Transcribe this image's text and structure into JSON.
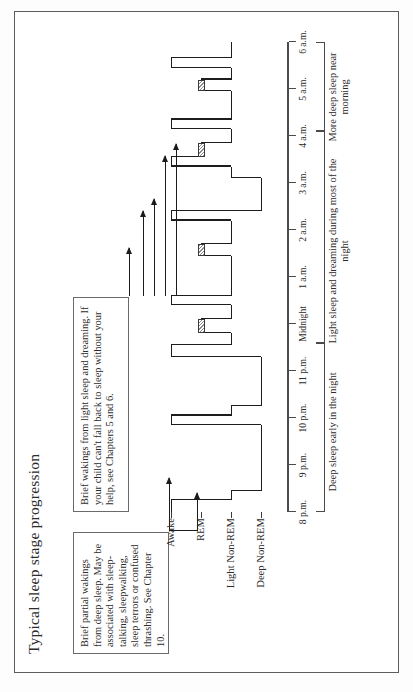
{
  "figure": {
    "title": "Typical sleep stage progression",
    "callouts": [
      {
        "id": "deep-sleep-callout",
        "text": "Brief partial wakings from deep sleep. May be associated with sleep-talking, sleepwalking, sleep terrors or confused thrashing. See Chapter 10."
      },
      {
        "id": "light-sleep-callout",
        "text": "Brief wakings from light sleep and dreaming. If your child can't fall back to sleep without your help, see Chapters 5 and 6."
      }
    ],
    "stage_labels": [
      "Awake",
      "REM",
      "Light Non-REM",
      "Deep Non-REM"
    ],
    "time_labels": [
      "8 p.m.",
      "9 p.m.",
      "10 p.m.",
      "11 p.m.",
      "Midnight",
      "1 a.m.",
      "2 a.m.",
      "3 a.m.",
      "4 a.m.",
      "5 a.m.",
      "6 a.m."
    ],
    "notes": [
      "Deep sleep early in the night",
      "Light sleep and dreaming during most of the night",
      "More deep sleep near morning"
    ],
    "colors": {
      "ink": "#1d1d1d",
      "rule": "#4a4a4a",
      "border": "#6a6a6a",
      "paper": "#ffffff"
    }
  },
  "chart_data": {
    "type": "line",
    "title": "Typical sleep stage progression",
    "xlabel": "",
    "ylabel": "",
    "grid": false,
    "legend": "none",
    "x_tick_labels": [
      "8 p.m.",
      "9 p.m.",
      "10 p.m.",
      "11 p.m.",
      "Midnight",
      "1 a.m.",
      "2 a.m.",
      "3 a.m.",
      "4 a.m.",
      "5 a.m.",
      "6 a.m."
    ],
    "x_tick_hours": [
      20,
      21,
      22,
      23,
      24,
      25,
      26,
      27,
      28,
      29,
      30
    ],
    "y_categories": [
      "Awake",
      "REM",
      "Light Non-REM",
      "Deep Non-REM"
    ],
    "y_levels": [
      0,
      1,
      2,
      3
    ],
    "xlim": [
      20,
      30
    ],
    "ylim": [
      0,
      3
    ],
    "hypnogram": [
      {
        "start": 20.0,
        "end": 20.25,
        "stage": "Awake"
      },
      {
        "start": 20.25,
        "end": 20.45,
        "stage": "Light Non-REM"
      },
      {
        "start": 20.45,
        "end": 21.85,
        "stage": "Deep Non-REM"
      },
      {
        "start": 21.85,
        "end": 22.05,
        "stage": "Awake"
      },
      {
        "start": 22.05,
        "end": 22.25,
        "stage": "Light Non-REM"
      },
      {
        "start": 22.25,
        "end": 23.3,
        "stage": "Deep Non-REM"
      },
      {
        "start": 23.3,
        "end": 23.55,
        "stage": "Awake"
      },
      {
        "start": 23.55,
        "end": 23.8,
        "stage": "Light Non-REM"
      },
      {
        "start": 23.8,
        "end": 24.1,
        "stage": "REM"
      },
      {
        "start": 24.1,
        "end": 24.4,
        "stage": "Light Non-REM"
      },
      {
        "start": 24.4,
        "end": 24.6,
        "stage": "Awake"
      },
      {
        "start": 24.6,
        "end": 25.45,
        "stage": "Light Non-REM"
      },
      {
        "start": 25.45,
        "end": 25.7,
        "stage": "REM"
      },
      {
        "start": 25.7,
        "end": 26.2,
        "stage": "Light Non-REM"
      },
      {
        "start": 26.2,
        "end": 26.4,
        "stage": "Awake"
      },
      {
        "start": 26.4,
        "end": 27.1,
        "stage": "Deep Non-REM"
      },
      {
        "start": 27.1,
        "end": 27.35,
        "stage": "Light Non-REM"
      },
      {
        "start": 27.35,
        "end": 27.55,
        "stage": "Awake"
      },
      {
        "start": 27.55,
        "end": 27.85,
        "stage": "REM"
      },
      {
        "start": 27.85,
        "end": 28.15,
        "stage": "Light Non-REM"
      },
      {
        "start": 28.15,
        "end": 28.35,
        "stage": "Awake"
      },
      {
        "start": 28.35,
        "end": 28.95,
        "stage": "Light Non-REM"
      },
      {
        "start": 28.95,
        "end": 29.2,
        "stage": "REM"
      },
      {
        "start": 29.2,
        "end": 29.45,
        "stage": "Light Non-REM"
      },
      {
        "start": 29.45,
        "end": 29.65,
        "stage": "Awake"
      },
      {
        "start": 29.65,
        "end": 30.0,
        "stage": "Light Non-REM"
      }
    ],
    "rem_periods": [
      {
        "start": 23.8,
        "end": 24.1
      },
      {
        "start": 25.45,
        "end": 25.7
      },
      {
        "start": 27.55,
        "end": 27.85
      },
      {
        "start": 28.95,
        "end": 29.2
      }
    ],
    "brief_wakings_deep": [
      21.95,
      23.4
    ],
    "brief_wakings_light": [
      24.5,
      26.3,
      27.45,
      28.25,
      29.55
    ],
    "annotations": [
      {
        "text": "Deep sleep early in the night",
        "span": [
          20.0,
          23.6
        ]
      },
      {
        "text": "Light sleep and dreaming during most of the night",
        "span": [
          23.6,
          28.1
        ]
      },
      {
        "text": "More deep sleep near morning",
        "span": [
          28.1,
          30.0
        ]
      }
    ]
  }
}
